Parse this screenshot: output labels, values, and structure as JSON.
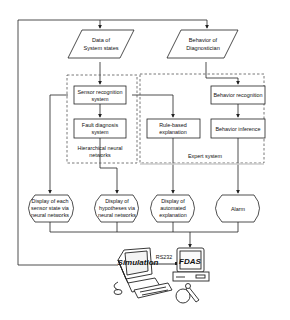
{
  "inputs": {
    "system_states": {
      "line1": "Data of",
      "line2": "System states"
    },
    "diagnostician": {
      "line1": "Behavior of",
      "line2": "Diagnostician"
    }
  },
  "groups": {
    "neural": {
      "label_line1": "Hierarchical neural",
      "label_line2": "networks"
    },
    "expert": {
      "label": "Expert system"
    }
  },
  "processes": {
    "sensor_recognition": {
      "line1": "Sensor recognition",
      "line2": "system"
    },
    "fault_diagnosis": {
      "line1": "Fault diagnosis",
      "line2": "system"
    },
    "rule_based": {
      "line1": "Rule-based",
      "line2": "explanation"
    },
    "behavior_recognition": {
      "line1": "Behavior recognition"
    },
    "behavior_inference": {
      "line1": "Behavior inference"
    }
  },
  "displays": [
    {
      "line1": "Display of each",
      "line2": "sensor state via",
      "line3": "neural networks"
    },
    {
      "line1": "Display of",
      "line2": "hypotheses via",
      "line3": "neural networks"
    },
    {
      "line1": "Display of",
      "line2": "automated",
      "line3": "explanation"
    },
    {
      "line1": "Alarm"
    }
  ],
  "hardware": {
    "simulator_label": "Simulation",
    "link_label": "RS232",
    "fdas_label": "FDAS"
  },
  "colors": {
    "line": "#222222",
    "dash": "#555555",
    "shadow": "#cfcfcf"
  }
}
